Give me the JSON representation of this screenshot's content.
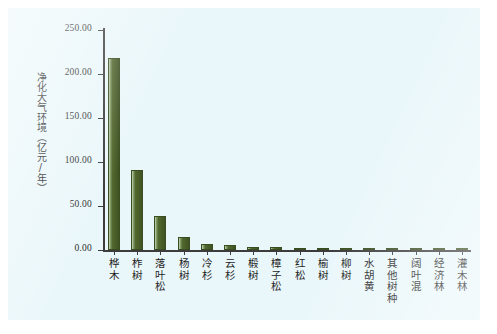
{
  "chart_data": {
    "type": "bar",
    "title": "",
    "xlabel": "",
    "ylabel": "净化大气环境（亿元/年）",
    "ylim": [
      0,
      250
    ],
    "yticks": [
      "0.00",
      "50.00",
      "100.00",
      "150.00",
      "200.00",
      "250.00"
    ],
    "ytick_values": [
      0,
      50,
      100,
      150,
      200,
      250
    ],
    "grid": false,
    "legend": "none",
    "bar_color": "#4f6630",
    "categories": [
      "桦木",
      "柞树",
      "落叶松",
      "杨树",
      "冷杉",
      "云杉",
      "椴树",
      "樟子松",
      "红松",
      "榆树",
      "柳树",
      "水胡黄",
      "其他树种",
      "阔叶混",
      "经济林",
      "灌木林"
    ],
    "values": [
      218.5,
      90.5,
      39.0,
      14.5,
      7.0,
      6.0,
      3.5,
      3.0,
      2.5,
      2.2,
      1.8,
      1.6,
      1.5,
      1.4,
      1.2,
      1.0
    ],
    "series": [
      {
        "name": "净化大气环境",
        "values": [
          218.5,
          90.5,
          39.0,
          14.5,
          7.0,
          6.0,
          3.5,
          3.0,
          2.5,
          2.2,
          1.8,
          1.6,
          1.5,
          1.4,
          1.2,
          1.0
        ]
      }
    ]
  }
}
